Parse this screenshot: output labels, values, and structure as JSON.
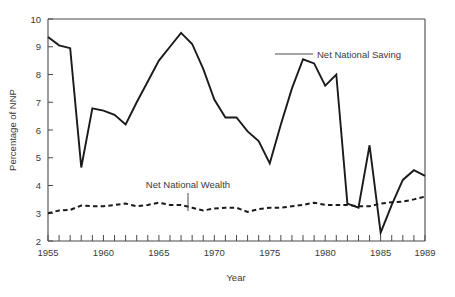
{
  "chart_data": {
    "type": "line",
    "title": "",
    "xlabel": "Year",
    "ylabel": "Percentage of NNP",
    "xlim": [
      1955,
      1989
    ],
    "ylim": [
      2,
      10
    ],
    "ytick_step": 1,
    "xtick_step": 1,
    "grid": false,
    "legend_position": "inline-annotations",
    "ytick_labels": [
      "2",
      "3",
      "4",
      "5",
      "6",
      "7",
      "8",
      "9",
      "10"
    ],
    "ytick_values": [
      2,
      3,
      4,
      5,
      6,
      7,
      8,
      9,
      10
    ],
    "xtick_labels": [
      "1955",
      "1960",
      "1965",
      "1970",
      "1975",
      "1980",
      "1985",
      "1989"
    ],
    "xtick_values": [
      1955,
      1960,
      1965,
      1970,
      1975,
      1980,
      1985,
      1989
    ],
    "x": [
      1955,
      1956,
      1957,
      1958,
      1959,
      1960,
      1961,
      1962,
      1963,
      1964,
      1965,
      1966,
      1967,
      1968,
      1969,
      1970,
      1971,
      1972,
      1973,
      1974,
      1975,
      1976,
      1977,
      1978,
      1979,
      1980,
      1981,
      1982,
      1983,
      1984,
      1985,
      1986,
      1987,
      1988,
      1989
    ],
    "series": [
      {
        "name": "Net National Saving",
        "style": "solid",
        "values": [
          9.35,
          9.05,
          8.95,
          4.65,
          6.78,
          6.7,
          6.55,
          6.2,
          7.0,
          7.75,
          8.5,
          9.0,
          9.5,
          9.1,
          8.2,
          7.1,
          6.45,
          6.45,
          5.95,
          5.6,
          4.8,
          6.2,
          7.5,
          8.55,
          8.4,
          7.6,
          8.0,
          3.35,
          3.2,
          5.45,
          2.3,
          3.3,
          4.2,
          4.55,
          4.35
        ]
      },
      {
        "name": "Net National Wealth",
        "style": "dashed",
        "values": [
          3.0,
          3.1,
          3.12,
          3.28,
          3.25,
          3.25,
          3.3,
          3.35,
          3.25,
          3.3,
          3.38,
          3.3,
          3.3,
          3.2,
          3.1,
          3.17,
          3.2,
          3.2,
          3.05,
          3.15,
          3.2,
          3.2,
          3.25,
          3.3,
          3.38,
          3.3,
          3.3,
          3.3,
          3.25,
          3.25,
          3.35,
          3.4,
          3.42,
          3.5,
          3.6
        ]
      }
    ],
    "annotations": [
      {
        "label": "Net National Saving",
        "points_to_year": 1976,
        "points_to_value": 9.5
      },
      {
        "label": "Net National Wealth",
        "points_to_year": 1967,
        "points_to_value": 3.3
      }
    ]
  }
}
